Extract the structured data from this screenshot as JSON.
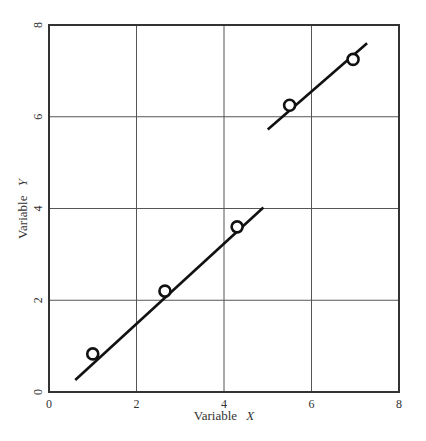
{
  "chart_data": {
    "type": "scatter",
    "title": "",
    "xlabel_prefix": "Variable",
    "xlabel_var": "X",
    "ylabel_prefix": "Variable",
    "ylabel_var": "Y",
    "xlim": [
      0,
      8
    ],
    "ylim": [
      0,
      8
    ],
    "x_ticks": [
      0,
      2,
      4,
      6,
      8
    ],
    "y_ticks": [
      0,
      2,
      4,
      6,
      8
    ],
    "grid": true,
    "legend": null,
    "series": [
      {
        "name": "observations",
        "marker": "open-circle",
        "points": [
          {
            "x": 1.0,
            "y": 0.83
          },
          {
            "x": 2.65,
            "y": 2.2
          },
          {
            "x": 4.3,
            "y": 3.6
          },
          {
            "x": 5.5,
            "y": 6.25
          },
          {
            "x": 6.95,
            "y": 7.25
          }
        ]
      }
    ],
    "fit_lines": [
      {
        "name": "fit-line-lower",
        "x1": 0.6,
        "y1": 0.26,
        "x2": 4.9,
        "y2": 4.02
      },
      {
        "name": "fit-line-upper",
        "x1": 5.0,
        "y1": 5.72,
        "x2": 7.27,
        "y2": 7.6
      }
    ],
    "colors": {
      "axis": "#333333",
      "grid": "#555555",
      "line": "#111111",
      "marker_fill": "#ffffff"
    }
  },
  "labels": {
    "x_axis": "Variable X",
    "y_axis": "Variable Y"
  }
}
